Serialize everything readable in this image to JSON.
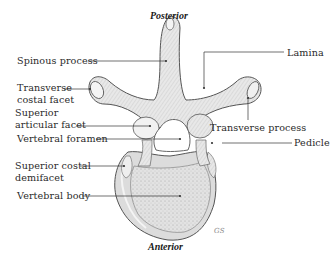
{
  "figure": {
    "orientation": {
      "top": "Posterior",
      "bottom": "Anterior"
    },
    "labels": {
      "spinous_process": "Spinous process",
      "transverse_costal_facet_line1": "Transverse",
      "transverse_costal_facet_line2": "costal facet",
      "superior_articular_facet_line1": "Superior",
      "superior_articular_facet_line2": "articular facet",
      "vertebral_foramen": "Vertebral foramen",
      "superior_costal_demifacet_line1": "Superior costal",
      "superior_costal_demifacet_line2": "demifacet",
      "vertebral_body": "Vertebral body",
      "lamina": "Lamina",
      "transverse_process": "Transverse process",
      "pedicle": "Pedicle"
    },
    "signature": "GS",
    "colors": {
      "bone_fill": "#ececec",
      "bone_shade": "#c9c9c9",
      "outline": "#555555",
      "leader": "#333333",
      "text": "#2a2a2a"
    }
  }
}
